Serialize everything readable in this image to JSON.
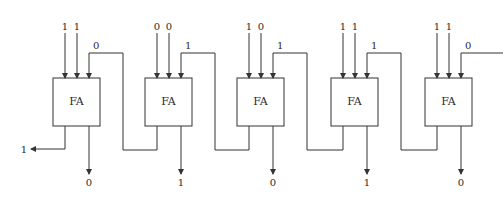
{
  "diagram": {
    "title": "",
    "type": "ripple-carry adder",
    "block_label": "FA",
    "stages": [
      {
        "a": "1",
        "b": "1",
        "carry_in": "0",
        "sum": "0"
      },
      {
        "a": "0",
        "b": "0",
        "carry_in": "1",
        "sum": "1"
      },
      {
        "a": "1",
        "b": "0",
        "carry_in": "1",
        "sum": "0"
      },
      {
        "a": "1",
        "b": "1",
        "carry_in": "1",
        "sum": "1"
      },
      {
        "a": "1",
        "b": "1",
        "carry_in": "0",
        "sum": "0"
      }
    ],
    "carry_out": "1"
  }
}
